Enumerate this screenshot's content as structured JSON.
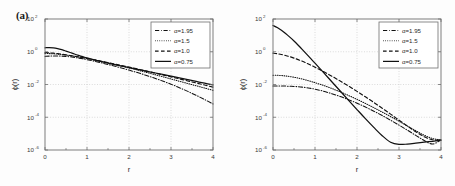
{
  "figure": {
    "panels": [
      {
        "tag": "(a)",
        "xlabel": "r",
        "ylabel": "ϕ(r)",
        "xticks": [
          "0",
          "1",
          "2",
          "3",
          "4"
        ],
        "yticks": [
          "10",
          "10",
          "10",
          "10",
          "10"
        ],
        "yexps": [
          "2",
          "0",
          "-2",
          "-4",
          "-6"
        ],
        "legend": [
          {
            "label": "α=1.95",
            "style": "dashdot"
          },
          {
            "label": "α=1.5",
            "style": "dot"
          },
          {
            "label": "α=1.0",
            "style": "dash"
          },
          {
            "label": "α=0.75",
            "style": "solid"
          }
        ]
      },
      {
        "tag": "(b)",
        "xlabel": "r",
        "ylabel": "ϕ(r)",
        "xticks": [
          "0",
          "1",
          "2",
          "3",
          "4"
        ],
        "yticks": [
          "10",
          "10",
          "10",
          "10",
          "10"
        ],
        "yexps": [
          "2",
          "0",
          "-2",
          "-4",
          "-6"
        ],
        "legend": [
          {
            "label": "α=1.95",
            "style": "dashdot"
          },
          {
            "label": "α=1.5",
            "style": "dot"
          },
          {
            "label": "α=1.0",
            "style": "dash"
          },
          {
            "label": "α=0.75",
            "style": "solid"
          }
        ]
      }
    ]
  },
  "chart_data": [
    {
      "type": "line",
      "title": "(a)",
      "xlabel": "r",
      "ylabel": "ϕ(r)",
      "xlim": [
        0,
        4
      ],
      "ylim": [
        1e-06,
        100
      ],
      "yscale": "log",
      "xscale": "linear",
      "grid": true,
      "legend_position": "top-right",
      "x": [
        0,
        0.1,
        0.2,
        0.3,
        0.4,
        0.5,
        0.6,
        0.7,
        0.8,
        0.9,
        1.0,
        1.2,
        1.4,
        1.6,
        1.8,
        2.0,
        2.2,
        2.4,
        2.6,
        2.8,
        3.0,
        3.2,
        3.4,
        3.6,
        3.8,
        4.0
      ],
      "series": [
        {
          "name": "α=1.95",
          "style": "dashdot",
          "values": [
            0.52,
            0.54,
            0.55,
            0.55,
            0.54,
            0.52,
            0.49,
            0.45,
            0.41,
            0.37,
            0.33,
            0.255,
            0.193,
            0.144,
            0.105,
            0.0755,
            0.0533,
            0.0368,
            0.0248,
            0.0163,
            0.0104,
            0.0064,
            0.0038,
            0.00218,
            0.00121,
            0.00065
          ]
        },
        {
          "name": "α=1.5",
          "style": "dot",
          "values": [
            0.78,
            0.77,
            0.75,
            0.72,
            0.68,
            0.63,
            0.58,
            0.53,
            0.48,
            0.435,
            0.39,
            0.307,
            0.238,
            0.182,
            0.138,
            0.103,
            0.0765,
            0.0563,
            0.0412,
            0.03,
            0.0218,
            0.0158,
            0.0115,
            0.00835,
            0.00608,
            0.0044
          ]
        },
        {
          "name": "α=1.0",
          "style": "dash",
          "values": [
            0.88,
            0.86,
            0.82,
            0.77,
            0.71,
            0.65,
            0.59,
            0.535,
            0.483,
            0.435,
            0.39,
            0.312,
            0.247,
            0.193,
            0.15,
            0.1155,
            0.0885,
            0.0675,
            0.0512,
            0.0387,
            0.0292,
            0.022,
            0.0165,
            0.0124,
            0.00925,
            0.0069
          ]
        },
        {
          "name": "α=0.75",
          "style": "solid",
          "values": [
            1.75,
            1.78,
            1.72,
            1.55,
            1.33,
            1.1,
            0.9,
            0.73,
            0.6,
            0.5,
            0.42,
            0.308,
            0.232,
            0.178,
            0.138,
            0.108,
            0.0845,
            0.0665,
            0.0522,
            0.041,
            0.0322,
            0.0252,
            0.0197,
            0.0154,
            0.012,
            0.0094
          ]
        }
      ]
    },
    {
      "type": "line",
      "title": "(b)",
      "xlabel": "r",
      "ylabel": "ϕ(r)",
      "xlim": [
        0,
        4
      ],
      "ylim": [
        1e-06,
        100
      ],
      "yscale": "log",
      "xscale": "linear",
      "grid": true,
      "legend_position": "top-right",
      "x": [
        0,
        0.1,
        0.2,
        0.3,
        0.4,
        0.5,
        0.6,
        0.7,
        0.8,
        0.9,
        1.0,
        1.2,
        1.4,
        1.6,
        1.8,
        2.0,
        2.2,
        2.4,
        2.6,
        2.8,
        3.0,
        3.2,
        3.4,
        3.6,
        3.8,
        4.0
      ],
      "series": [
        {
          "name": "α=1.95",
          "style": "dashdot",
          "values": [
            0.0082,
            0.0082,
            0.0081,
            0.008,
            0.0078,
            0.0076,
            0.0073,
            0.0069,
            0.0064,
            0.0058,
            0.0052,
            0.0039,
            0.00275,
            0.00185,
            0.00118,
            0.00072,
            0.00042,
            0.000235,
            0.000127,
            6.6e-05,
            3.3e-05,
            1.62e-05,
            7.8e-06,
            3.8e-06,
            2.3e-06,
            4.2e-06
          ]
        },
        {
          "name": "α=1.5",
          "style": "dot",
          "values": [
            0.037,
            0.0365,
            0.0352,
            0.0332,
            0.0306,
            0.0277,
            0.0246,
            0.0214,
            0.0183,
            0.0155,
            0.013,
            0.0088,
            0.0057,
            0.00355,
            0.00213,
            0.00124,
            0.0007,
            0.000385,
            0.000207,
            0.00011,
            5.7e-05,
            2.9e-05,
            1.5e-05,
            8e-06,
            5e-06,
            4.2e-06
          ]
        },
        {
          "name": "α=1.0",
          "style": "dash",
          "values": [
            0.82,
            0.76,
            0.68,
            0.59,
            0.5,
            0.41,
            0.33,
            0.26,
            0.2,
            0.152,
            0.114,
            0.0615,
            0.0322,
            0.0163,
            0.008,
            0.0038,
            0.00176,
            0.0008,
            0.000355,
            0.000155,
            6.7e-05,
            2.9e-05,
            1.3e-05,
            6.5e-06,
            4.2e-06,
            4e-06
          ]
        },
        {
          "name": "α=0.75",
          "style": "solid",
          "values": [
            40.0,
            30.0,
            20.5,
            13.0,
            7.8,
            4.5,
            2.5,
            1.35,
            0.72,
            0.38,
            0.2,
            0.0545,
            0.0148,
            0.004,
            0.00108,
            0.000295,
            8.2e-05,
            2.4e-05,
            7.5e-06,
            3e-06,
            2.2e-06,
            2.3e-06,
            2.6e-06,
            3e-06,
            3.4e-06,
            3.9e-06
          ]
        }
      ]
    }
  ]
}
